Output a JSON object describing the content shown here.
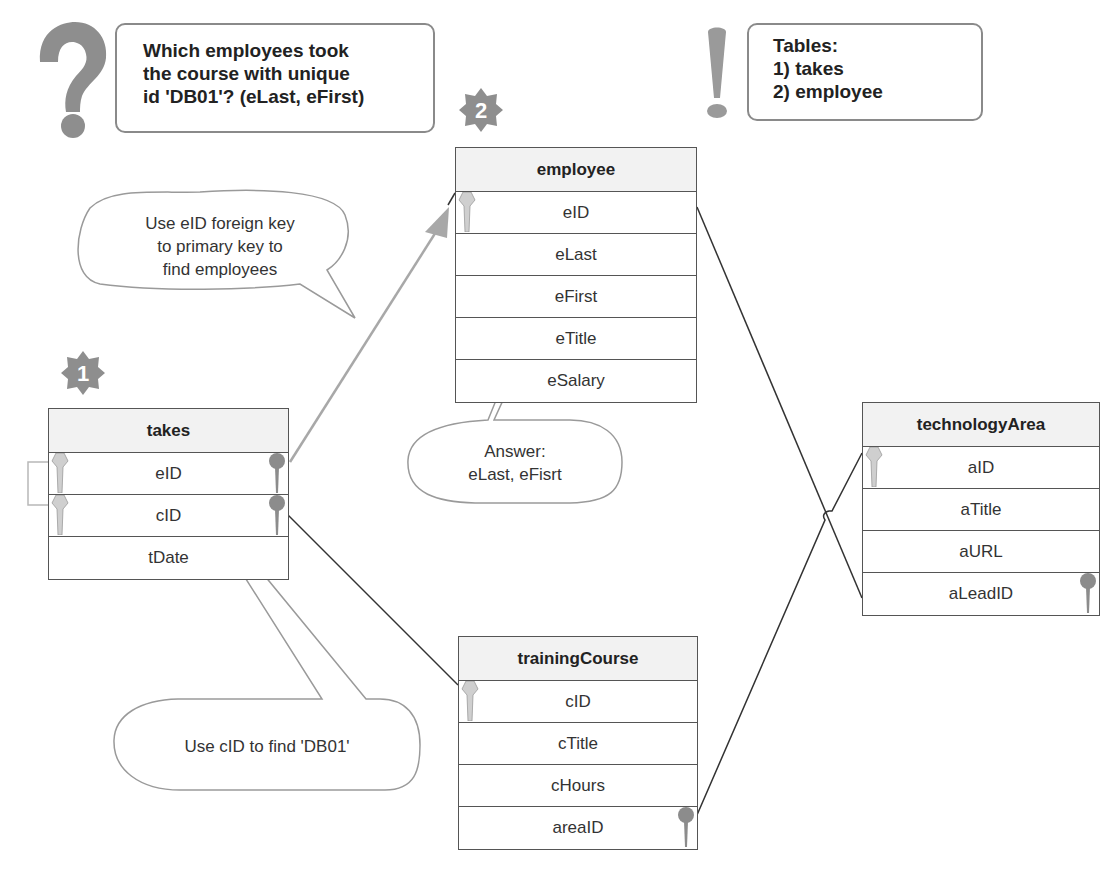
{
  "question": {
    "icon": "question-mark-icon",
    "lines": [
      "Which employees took",
      "the course with unique",
      "id 'DB01'? (eLast, eFirst)"
    ]
  },
  "tables_note": {
    "icon": "exclamation-icon",
    "lines": [
      "Tables:",
      "1) takes",
      "2) employee"
    ]
  },
  "steps": [
    {
      "label": "1",
      "icon": "starburst-badge-icon"
    },
    {
      "label": "2",
      "icon": "starburst-badge-icon"
    }
  ],
  "tables": {
    "takes": {
      "title": "takes",
      "fields": [
        "eID",
        "cID",
        "tDate"
      ]
    },
    "employee": {
      "title": "employee",
      "fields": [
        "eID",
        "eLast",
        "eFirst",
        "eTitle",
        "eSalary"
      ]
    },
    "trainingCourse": {
      "title": "trainingCourse",
      "fields": [
        "cID",
        "cTitle",
        "cHours",
        "areaID"
      ]
    },
    "technologyArea": {
      "title": "technologyArea",
      "fields": [
        "aID",
        "aTitle",
        "aURL",
        "aLeadID"
      ]
    }
  },
  "callouts": {
    "foreign_key": [
      "Use eID foreign key",
      "to primary key to",
      "find employees"
    ],
    "answer": [
      "Answer:",
      "eLast, eFisrt"
    ],
    "cid": "Use cID to find 'DB01'"
  },
  "colors": {
    "primary_key": "#cfcfcf",
    "foreign_key": "#8c8c8c",
    "callout_border": "#9a9a9a",
    "icon_gray": "#8e8e8e",
    "header_bg": "#f2f2f2"
  }
}
